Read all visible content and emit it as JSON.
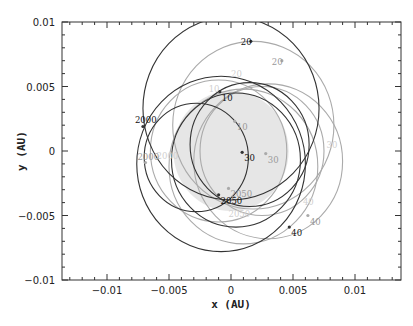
{
  "chart_data": {
    "type": "scatter",
    "title": "",
    "xlabel": "x (AU)",
    "ylabel": "y (AU)",
    "xlim": [
      -0.0136,
      0.0137
    ],
    "ylim": [
      -0.01,
      0.01
    ],
    "x_ticks": [
      -0.01,
      -0.005,
      0,
      0.005,
      0.01
    ],
    "x_tick_labels": [
      "−0.01",
      "−0.005",
      "0",
      "0.005",
      "0.01"
    ],
    "y_ticks": [
      -0.01,
      -0.005,
      0,
      0.005,
      0.01
    ],
    "y_tick_labels": [
      "−0.01",
      "−0.005",
      "0",
      "0.005",
      "0.01"
    ],
    "grid": false,
    "legend": null,
    "sun_disk": {
      "cx": 0.0,
      "cy": 0.0,
      "r": 0.00465,
      "fill": "#e6e6e6"
    },
    "series": [
      {
        "name": "dark trajectory",
        "color": "#333333",
        "orbits": [
          {
            "cx": 0.0,
            "cy": 0.0033,
            "r": 0.0071
          },
          {
            "cx": 0.0015,
            "cy": 0.0005,
            "r": 0.0048
          },
          {
            "cx": 0.0004,
            "cy": -0.0007,
            "r": 0.0052
          },
          {
            "cx": -0.0028,
            "cy": -0.0005,
            "r": 0.0042
          },
          {
            "cx": -0.0008,
            "cy": -0.001,
            "r": 0.0068
          }
        ],
        "points": [
          {
            "label": "2000",
            "x": -0.0071,
            "y": 0.0019
          },
          {
            "label": "10",
            "x": -0.0009,
            "y": 0.0046
          },
          {
            "label": "20",
            "x": 0.0016,
            "y": 0.0085
          },
          {
            "label": "30",
            "x": 0.0009,
            "y": -0.0001
          },
          {
            "label": "40",
            "x": 0.0047,
            "y": -0.0059
          },
          {
            "label": "2050",
            "x": -0.001,
            "y": -0.0034
          }
        ]
      },
      {
        "name": "light trajectory",
        "color": "#aaaaaa",
        "orbits": [
          {
            "cx": 0.0018,
            "cy": 0.002,
            "r": 0.0065
          },
          {
            "cx": 0.0025,
            "cy": 0.0,
            "r": 0.005
          },
          {
            "cx": 0.003,
            "cy": -0.0008,
            "r": 0.006
          },
          {
            "cx": 0.001,
            "cy": -0.0012,
            "r": 0.006
          },
          {
            "cx": -0.001,
            "cy": 0.0,
            "r": 0.0055
          }
        ],
        "points": [
          {
            "label": "2000",
            "x": -0.0069,
            "y": -0.0009
          },
          {
            "label": "10",
            "x": 0.0003,
            "y": 0.0023
          },
          {
            "label": "20",
            "x": 0.0041,
            "y": 0.007
          },
          {
            "label": "30",
            "x": 0.0028,
            "y": -0.0002
          },
          {
            "label": "40",
            "x": 0.0062,
            "y": -0.005
          },
          {
            "label": "2050",
            "x": -0.0002,
            "y": -0.0029
          }
        ]
      }
    ],
    "faint_labels": [
      {
        "text": "10",
        "x": -0.0018,
        "y": 0.0046
      },
      {
        "text": "20",
        "x": 0.0,
        "y": 0.0057
      },
      {
        "text": "2000",
        "x": -0.006,
        "y": -0.0006
      },
      {
        "text": "30",
        "x": 0.0077,
        "y": 0.0002
      },
      {
        "text": "40",
        "x": 0.0058,
        "y": -0.0042
      },
      {
        "text": "2050",
        "x": -0.0002,
        "y": -0.0051
      }
    ]
  },
  "plot_frame": {
    "left": 62,
    "top": 22,
    "right": 401,
    "bottom": 280
  }
}
